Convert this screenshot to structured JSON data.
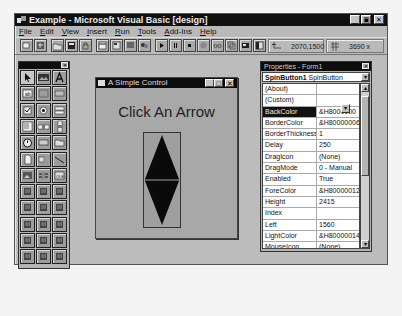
{
  "window": {
    "title": "Example - Microsoft Visual Basic [design]",
    "controls": [
      "minimize",
      "maximize",
      "close"
    ]
  },
  "menu": [
    "File",
    "Edit",
    "View",
    "Insert",
    "Run",
    "Tools",
    "Add-Ins",
    "Help"
  ],
  "toolbar": {
    "buttons": [
      "add-project",
      "add-form",
      "open-project",
      "save-project",
      "lock-controls",
      "menu-editor",
      "project-explorer",
      "properties-window",
      "form-layout",
      "start",
      "break",
      "end",
      "toggle-breakpoint",
      "instant-watch",
      "calls",
      "object-browser",
      "toolbox"
    ],
    "position": "2070,1500",
    "size": "3690 x 4110"
  },
  "toolbox": {
    "tools": [
      "pointer",
      "picturebox",
      "label",
      "textbox",
      "frame",
      "commandbutton",
      "checkbox",
      "optionbutton",
      "combobox",
      "listbox",
      "hscrollbar",
      "vscrollbar",
      "timer",
      "drivelistbox",
      "dirlistbox",
      "filelistbox",
      "shape",
      "line",
      "image",
      "data",
      "ole",
      "spinbutton",
      "animation",
      "graph",
      "grid",
      "outline",
      "gauge",
      "keystate",
      "msflexgrid",
      "comm",
      "richtext",
      "sstab",
      "tabstrip",
      "toolbar",
      "statusbar",
      "treeview"
    ]
  },
  "form": {
    "title": "A Simple Control",
    "label": "Click An Arrow",
    "controls": [
      "minimize",
      "maximize",
      "close"
    ]
  },
  "properties": {
    "title": "Properties - Form1",
    "object_name": "SpinButton1",
    "object_type": "SpinButton",
    "rows": [
      {
        "name": "(About)",
        "value": ""
      },
      {
        "name": "(Custom)",
        "value": ""
      },
      {
        "name": "BackColor",
        "value": "&H8000000",
        "selected": true
      },
      {
        "name": "BorderColor",
        "value": "&H80000006&"
      },
      {
        "name": "BorderThickness",
        "value": "1"
      },
      {
        "name": "Delay",
        "value": "250"
      },
      {
        "name": "DragIcon",
        "value": "(None)"
      },
      {
        "name": "DragMode",
        "value": "0 - Manual"
      },
      {
        "name": "Enabled",
        "value": "True"
      },
      {
        "name": "ForeColor",
        "value": "&H80000012&"
      },
      {
        "name": "Height",
        "value": "2415"
      },
      {
        "name": "Index",
        "value": ""
      },
      {
        "name": "Left",
        "value": "1560"
      },
      {
        "name": "LightColor",
        "value": "&H80000014&"
      },
      {
        "name": "MouseIcon",
        "value": "(None)"
      },
      {
        "name": "MousePointer",
        "value": "0 - Default"
      },
      {
        "name": "Name",
        "value": "SpinButton1"
      }
    ]
  },
  "colors": {
    "titlebar": "#101010",
    "face": "#b9b9b9",
    "desktop": "#bcbcbc",
    "arrow": "#0a0a0a"
  }
}
